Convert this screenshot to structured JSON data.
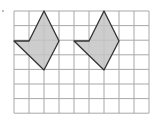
{
  "grid": {
    "x0": 14,
    "y0": 11,
    "cell_w": 15,
    "cell_h": 14.6,
    "cols": 9,
    "rows": 7,
    "line_color": "#a8a8a8"
  },
  "shapes": [
    {
      "name": "shape-1",
      "points": "44,11 59,41 44,70 14,41 29,41",
      "fill": "#c4c4c4",
      "stroke": "#333333"
    },
    {
      "name": "shape-2",
      "points": "104,11 119,41 104,70 74,41 89,41",
      "fill": "#c4c4c4",
      "stroke": "#333333"
    }
  ]
}
